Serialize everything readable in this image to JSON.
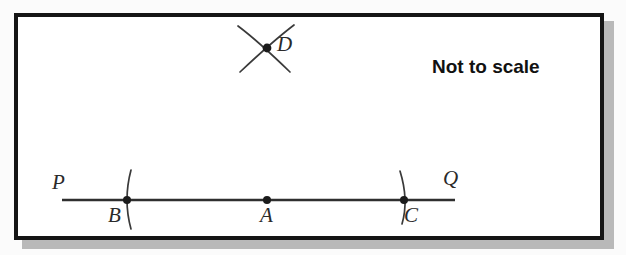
{
  "figure": {
    "note_label": "Not to scale",
    "background_color": "#fbfbfb",
    "frame_color": "#151515",
    "frame_shadow_color": "#b9b9b9",
    "interior_color": "#ffffff",
    "ink_color": "#3a3a3a",
    "label_color": "#2a2a2a",
    "line": {
      "name": "PQ",
      "x1": 62,
      "y1": 200,
      "x2": 455,
      "y2": 200,
      "stroke_width": 2.6
    },
    "labels": {
      "P": "P",
      "Q": "Q",
      "A": "A",
      "B": "B",
      "C": "C",
      "D": "D"
    },
    "points": [
      {
        "id": "A",
        "label": "A",
        "x": 267,
        "y": 200,
        "radius": 4.0,
        "label_x": 260,
        "label_y": 205
      },
      {
        "id": "B",
        "label": "B",
        "x": 127,
        "y": 200,
        "radius": 4.0,
        "label_x": 108,
        "label_y": 205
      },
      {
        "id": "C",
        "label": "C",
        "x": 404,
        "y": 200,
        "radius": 4.0,
        "label_x": 404,
        "label_y": 205
      },
      {
        "id": "D",
        "label": "D",
        "x": 267,
        "y": 48,
        "radius": 4.4,
        "label_x": 277,
        "label_y": 34
      }
    ],
    "endpoint_labels": [
      {
        "id": "P",
        "label": "P",
        "label_x": 52,
        "label_y": 172
      },
      {
        "id": "Q",
        "label": "Q",
        "label_x": 443,
        "label_y": 168
      }
    ],
    "arcs": [
      {
        "id": "arc-through-b",
        "d": "M 131 170 Q 123 200 131 229",
        "stroke_width": 1.7
      },
      {
        "id": "arc-through-c",
        "d": "M 400 171 Q 409 200 402 224",
        "stroke_width": 1.7
      },
      {
        "id": "arc-d-from-b",
        "d": "M 238 26 Q 258 41 290 72",
        "stroke_width": 1.7
      },
      {
        "id": "arc-d-from-c",
        "d": "M 294 25 Q 273 41 240 72",
        "stroke_width": 1.7
      }
    ],
    "note_position": {
      "x": 432,
      "y": 57,
      "font_size": 19
    }
  }
}
